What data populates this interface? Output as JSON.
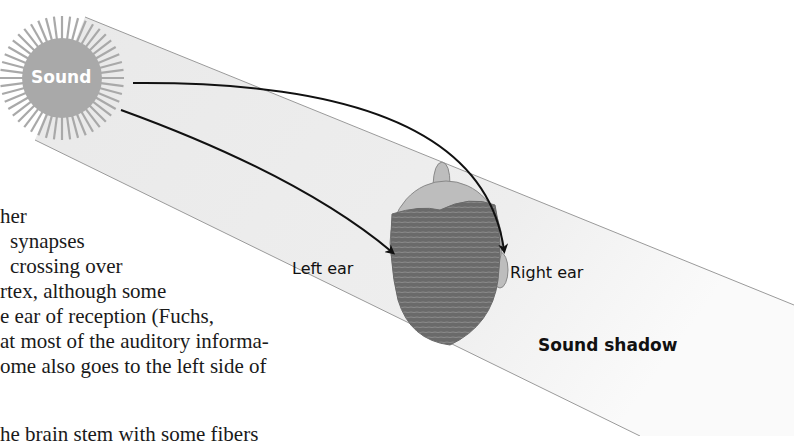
{
  "figure": {
    "source_label": "Sound",
    "left_ear_label": "Left ear",
    "right_ear_label": "Right ear",
    "shadow_label": "Sound shadow",
    "colors": {
      "sun": "#a9a9a9",
      "beam_fill": "#ececec",
      "beam_edge": "#9a9a9a",
      "head_skin": "#b8b8b8",
      "hair": "#6e6e6e",
      "arrow": "#111111"
    }
  },
  "body_text": {
    "lines": [
      "her",
      "synapses",
      "crossing over",
      "rtex,  although  some",
      "e ear of reception (Fuchs,",
      "at most of the auditory informa-",
      "ome also goes to the left side of",
      "he brain stem with some fibers"
    ]
  }
}
